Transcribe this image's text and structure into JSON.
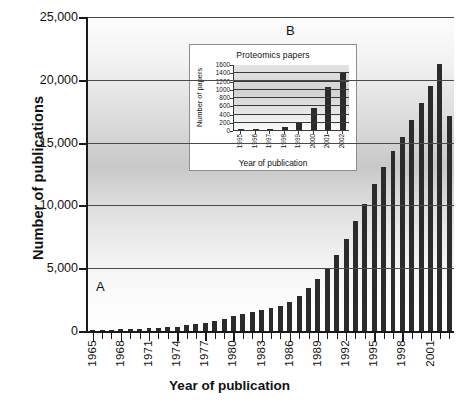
{
  "figure": {
    "annotation_a": "A",
    "annotation_b": "B"
  },
  "chart_data": {
    "type": "bar",
    "title": "",
    "xlabel": "Year of publication",
    "ylabel": "Number of publications",
    "ylim": [
      0,
      25000
    ],
    "yticks": [
      0,
      5000,
      10000,
      15000,
      20000,
      25000
    ],
    "ytick_labels": [
      "0",
      "5,000",
      "10,000",
      "15,000",
      "20,000",
      "25,000"
    ],
    "grid": true,
    "legend": "none",
    "categories": [
      "1965",
      "1966",
      "1967",
      "1968",
      "1969",
      "1970",
      "1971",
      "1972",
      "1973",
      "1974",
      "1975",
      "1976",
      "1977",
      "1978",
      "1979",
      "1980",
      "1981",
      "1982",
      "1983",
      "1984",
      "1985",
      "1986",
      "1987",
      "1988",
      "1989",
      "1990",
      "1991",
      "1992",
      "1993",
      "1994",
      "1995",
      "1996",
      "1997",
      "1998",
      "1999",
      "2000",
      "2001",
      "2002",
      "2003"
    ],
    "xtick_labels": [
      "1965",
      "1968",
      "1971",
      "1974",
      "1977",
      "1980",
      "1983",
      "1986",
      "1989",
      "1992",
      "1995",
      "1998",
      "2001"
    ],
    "values": [
      150,
      170,
      190,
      210,
      230,
      260,
      290,
      330,
      380,
      430,
      520,
      620,
      750,
      900,
      1050,
      1250,
      1450,
      1600,
      1750,
      1900,
      2100,
      2400,
      2900,
      3500,
      4200,
      5000,
      6100,
      7400,
      8800,
      10200,
      11800,
      13100,
      14400,
      15500,
      16900,
      18200,
      19600,
      21300,
      17200
    ]
  },
  "inset": {
    "chart_data": {
      "type": "bar",
      "title": "Proteomics papers",
      "xlabel": "Year of publication",
      "ylabel": "Number of papers",
      "ylim": [
        0,
        1600
      ],
      "yticks": [
        0,
        200,
        400,
        600,
        800,
        1000,
        1200,
        1400,
        1600
      ],
      "ytick_labels": [
        "0",
        "200",
        "400",
        "600",
        "800",
        "1000",
        "1200",
        "1400",
        "1600"
      ],
      "grid": true,
      "categories": [
        "1995",
        "1996",
        "1997",
        "1998",
        "1999",
        "2000",
        "2001",
        "2002"
      ],
      "values": [
        2,
        12,
        28,
        65,
        200,
        540,
        1040,
        1400
      ]
    }
  },
  "colors": {
    "bar": "#2b2b2b",
    "axis": "#1a1a1a",
    "grid": "#4a4a4a",
    "inset_border": "#8d8d8d"
  }
}
